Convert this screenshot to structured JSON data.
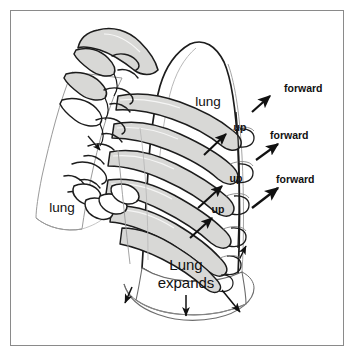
{
  "figure": {
    "border_color": "#8a8a8a",
    "background_color": "#ffffff",
    "ink_color": "#111111",
    "bone_fill_color": "#d8d8d6",
    "outline_light_color": "#9a9a9a"
  },
  "labels": {
    "lung_left": "lung",
    "lung_right": "lung",
    "lung_expands_line1": "Lung",
    "lung_expands_line2": "expands",
    "up_1": "up",
    "up_2": "up",
    "up_3": "up",
    "forward_1": "forward",
    "forward_2": "forward",
    "forward_3": "forward"
  },
  "annotations": {
    "rib_motion": [
      {
        "label": "up",
        "direction": "up-right",
        "x": 222,
        "y": 127
      },
      {
        "label": "up",
        "direction": "up-right",
        "x": 218,
        "y": 179
      },
      {
        "label": "up",
        "direction": "up-right",
        "x": 208,
        "y": 212
      }
    ],
    "sternum_motion": [
      {
        "label": "forward",
        "direction": "up-right",
        "x": 295,
        "y": 90
      },
      {
        "label": "forward",
        "direction": "up-right",
        "x": 303,
        "y": 137
      },
      {
        "label": "forward",
        "direction": "up-right",
        "x": 296,
        "y": 182
      }
    ],
    "diaphragm_motion": [
      {
        "direction": "down-left",
        "x": 128,
        "y": 302
      },
      {
        "direction": "down",
        "x": 186,
        "y": 314
      },
      {
        "direction": "down-right",
        "x": 236,
        "y": 310
      }
    ]
  },
  "anatomy": {
    "parts": [
      "thoracic-spine",
      "vertebrae",
      "ribs",
      "left-lung",
      "right-lung",
      "diaphragm"
    ],
    "rib_count_visible": 6
  }
}
